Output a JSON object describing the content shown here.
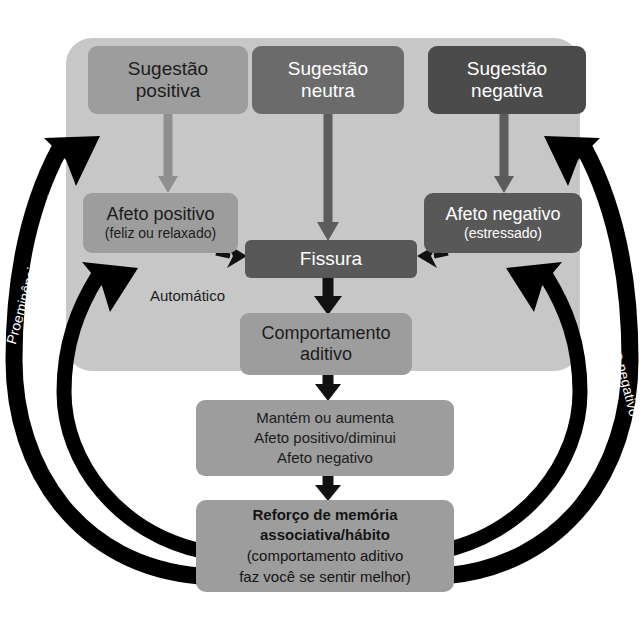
{
  "diagram": {
    "automatic_label": "Automático",
    "colors": {
      "panel_background": "#c7c7c7",
      "page_background": "#ffffff",
      "box_light": "#9d9d9d",
      "box_medium": "#6b6b6b",
      "box_dark": "#4b4b4b",
      "box_fissura": "#585858",
      "arrow_black": "#000000",
      "arrow_light_gray": "#8f8f8f",
      "arrow_dark_gray": "#5c5c5c",
      "text_dark": "#1c1c1c",
      "text_light": "#ffffff"
    },
    "nodes": {
      "sugestao_positiva": {
        "line1": "Sugestão",
        "line2": "positiva"
      },
      "sugestao_neutra": {
        "line1": "Sugestão",
        "line2": "neutra"
      },
      "sugestao_negativa": {
        "line1": "Sugestão",
        "line2": "negativa"
      },
      "afeto_positivo": {
        "line1": "Afeto positivo",
        "line2": "(feliz ou relaxado)"
      },
      "afeto_negativo": {
        "line1": "Afeto negativo",
        "line2": "(estressado)"
      },
      "fissura": {
        "line1": "Fissura"
      },
      "comportamento_aditivo": {
        "line1": "Comportamento",
        "line2": "aditivo"
      },
      "mantem_aumenta": {
        "line1": "Mantém ou aumenta",
        "line2": "Afeto positivo/diminui",
        "line3": "Afeto negativo"
      },
      "reforco_memoria": {
        "line1": "Reforço de memória",
        "line2": "associativa/hábito",
        "line3": "(comportamento aditivo",
        "line4": "faz você se sentir melhor)"
      }
    },
    "curve_labels": {
      "proeminencia_left": "Proeminência aumentada",
      "reforco_positivo": "Reforço positivo",
      "proeminencia_right": "Proeminência aumentada",
      "reforco_negativo": "Reforço negativo"
    }
  }
}
